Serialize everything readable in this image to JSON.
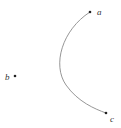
{
  "diagram": {
    "points": [
      {
        "id": "a",
        "label": "a",
        "x": 90,
        "y": 12
      },
      {
        "id": "b",
        "label": "b",
        "x": 15,
        "y": 76
      },
      {
        "id": "c",
        "label": "c",
        "x": 106,
        "y": 113
      }
    ],
    "curve": {
      "from": "a",
      "to": "c",
      "description": "curve bulging left toward b"
    },
    "colors": {
      "curve": "#8a8a8a",
      "point": "#222222",
      "label": "#333333"
    }
  }
}
